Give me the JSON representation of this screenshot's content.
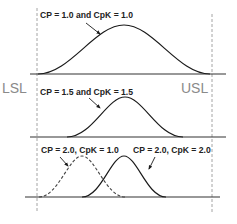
{
  "diagram": {
    "type": "process-capability-illustration",
    "spec_limits": {
      "lower": {
        "label": "LSL",
        "x": 37
      },
      "upper": {
        "label": "USL",
        "x": 212
      }
    },
    "panels": [
      {
        "id": "panel-1",
        "baseline_y": 74,
        "curves": [
          {
            "label": "CP = 1.0 and CpK = 1.0",
            "style": "solid",
            "center_x": 124,
            "left_x": 38,
            "right_x": 210,
            "peak_y": 25
          }
        ]
      },
      {
        "id": "panel-2",
        "baseline_y": 137,
        "curves": [
          {
            "label": "CP = 1.5 and CpK = 1.5",
            "style": "solid",
            "center_x": 125,
            "left_x": 67,
            "right_x": 183,
            "peak_y": 97
          }
        ]
      },
      {
        "id": "panel-3",
        "baseline_y": 197,
        "curves": [
          {
            "label": "CP = 2.0, CpK = 1.0",
            "style": "dashed",
            "center_x": 82,
            "left_x": 39,
            "right_x": 125,
            "peak_y": 156
          },
          {
            "label": "CP = 2.0, CpK = 2.0",
            "style": "solid",
            "center_x": 124,
            "left_x": 82,
            "right_x": 166,
            "peak_y": 156
          }
        ]
      }
    ],
    "colors": {
      "curve": "#1a1a1a",
      "baseline": "#333333",
      "spec_line": "#9a9a9a",
      "spec_text": "#8a8a8a",
      "label_text": "#222222"
    }
  }
}
